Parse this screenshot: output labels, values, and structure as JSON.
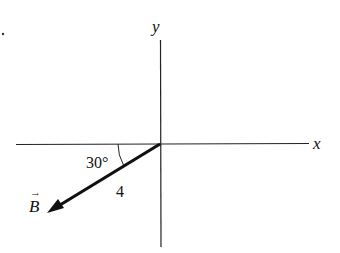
{
  "diagram": {
    "axes": {
      "x_label": "x",
      "y_label": "y"
    },
    "vector": {
      "name": "B",
      "name_arrow": "→",
      "magnitude_label": "4",
      "angle_label": "30°"
    },
    "colors": {
      "ink": "#111111",
      "background": "#ffffff"
    }
  }
}
